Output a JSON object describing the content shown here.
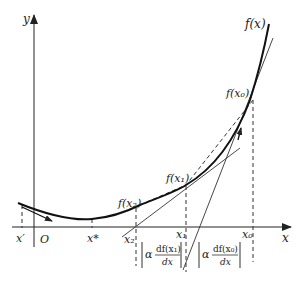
{
  "diagram": {
    "axes": {
      "x_label": "x",
      "y_label": "y",
      "origin_label": "O"
    },
    "curve_label": "f(x)",
    "points": {
      "f_x0": "f(x₀)",
      "f_x1": "f(x₁)",
      "f_x2": "f(x₂)"
    },
    "x_ticks": {
      "x_prime": "x′",
      "x_star": "x*",
      "x2": "x₂",
      "x1": "x₁",
      "x0": "x₀"
    },
    "step_labels": [
      {
        "alpha": "α",
        "numerator": "df(x₁)",
        "denominator": "dx"
      },
      {
        "alpha": "α",
        "numerator": "df(x₀)",
        "denominator": "dx"
      }
    ],
    "colors": {
      "curve": "#111111",
      "axis": "#222222",
      "line": "#333333"
    }
  }
}
